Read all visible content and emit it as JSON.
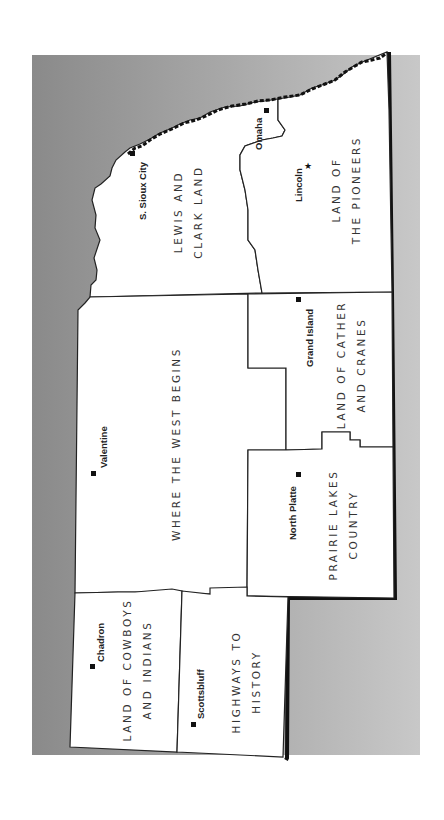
{
  "map": {
    "title": "Nebraska Travel Regions",
    "orientation": "rotated 90 degrees clockwise",
    "colors": {
      "background": "#ffffff",
      "panel_dark": "#8c8c8c",
      "panel_light": "#c4c4c4",
      "region_fill": "#ffffff",
      "border": "#222222"
    },
    "regions": [
      {
        "id": "lewis-clark",
        "lines": [
          "LEWIS AND",
          "CLARK LAND"
        ]
      },
      {
        "id": "pioneers",
        "lines": [
          "LAND OF",
          "THE PIONEERS"
        ]
      },
      {
        "id": "west-begins",
        "lines": [
          "WHERE THE WEST BEGINS"
        ]
      },
      {
        "id": "cather-cranes",
        "lines": [
          "LAND OF CATHER",
          "AND CRANES"
        ]
      },
      {
        "id": "prairie-lakes",
        "lines": [
          "PRAIRIE LAKES",
          "COUNTRY"
        ]
      },
      {
        "id": "cowboys-indians",
        "lines": [
          "LAND OF COWBOYS",
          "AND INDIANS"
        ]
      },
      {
        "id": "highways-history",
        "lines": [
          "HIGHWAYS TO",
          "HISTORY"
        ]
      }
    ],
    "cities": [
      {
        "name": "S. Sioux City",
        "marker": "square"
      },
      {
        "name": "Omaha",
        "marker": "square"
      },
      {
        "name": "Lincoln",
        "marker": "star",
        "capital": true
      },
      {
        "name": "Grand Island",
        "marker": "square"
      },
      {
        "name": "Valentine",
        "marker": "square"
      },
      {
        "name": "North Platte",
        "marker": "square"
      },
      {
        "name": "Chadron",
        "marker": "square"
      },
      {
        "name": "Scottsbluff",
        "marker": "square"
      }
    ]
  }
}
